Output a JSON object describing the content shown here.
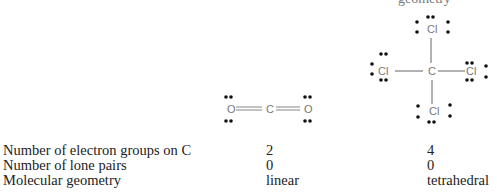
{
  "header": {
    "cropped_text": "geometry"
  },
  "diagrams": {
    "co2": {
      "left_atom": "O",
      "center_atom": "C",
      "right_atom": "O",
      "bond": "double"
    },
    "ccl4": {
      "center_atom": "C",
      "top_atom": "Cl",
      "left_atom": "Cl",
      "right_atom": "Cl",
      "bottom_atom": "Cl",
      "bond": "single"
    }
  },
  "table": {
    "rows": [
      {
        "label": "Number of electron groups on C",
        "co2": "2",
        "ccl4": "4"
      },
      {
        "label": "Number of lone pairs",
        "co2": "0",
        "ccl4": "0"
      },
      {
        "label": "Molecular geometry",
        "co2": "linear",
        "ccl4": "tetrahedral"
      }
    ]
  }
}
